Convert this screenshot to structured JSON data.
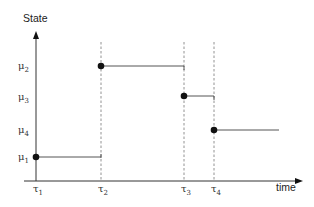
{
  "diagram": {
    "y_axis_label": "State",
    "x_axis_label": "time",
    "y_ticks": [
      {
        "label": "μ",
        "sub": "2",
        "y": 66
      },
      {
        "label": "μ",
        "sub": "3",
        "y": 97
      },
      {
        "label": "μ",
        "sub": "4",
        "y": 130
      },
      {
        "label": "μ",
        "sub": "1",
        "y": 157
      }
    ],
    "x_ticks": [
      {
        "label": "τ",
        "sub": "1",
        "x": 36
      },
      {
        "label": "τ",
        "sub": "2",
        "x": 101
      },
      {
        "label": "τ",
        "sub": "3",
        "x": 184
      },
      {
        "label": "τ",
        "sub": "4",
        "x": 214
      }
    ],
    "segments": [
      {
        "state": "μ1",
        "x_start": 36,
        "x_end": 101,
        "y": 157
      },
      {
        "state": "μ2",
        "x_start": 101,
        "x_end": 184,
        "y": 66
      },
      {
        "state": "μ3",
        "x_start": 184,
        "x_end": 214,
        "y": 96
      },
      {
        "state": "μ4",
        "x_start": 214,
        "x_end": 279,
        "y": 130
      }
    ],
    "colors": {
      "axis": "#333333",
      "step_line": "#555555",
      "dashed": "#777777",
      "dot": "#111111"
    }
  }
}
